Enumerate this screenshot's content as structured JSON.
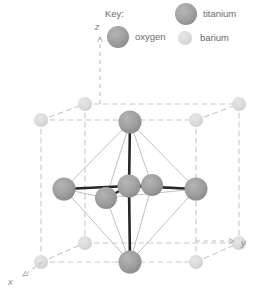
{
  "figure": {
    "kind": "crystal-structure-unit-cell"
  },
  "key": {
    "title": "Key:",
    "entries": [
      {
        "label": "titanium",
        "color": "#9e9e9e",
        "radius": 11
      },
      {
        "label": "oxygen",
        "color": "#9b9b9b",
        "radius": 11
      },
      {
        "label": "barium",
        "color": "#d9d9d9",
        "radius": 7
      }
    ]
  },
  "axes": {
    "x": {
      "label": "x"
    },
    "y": {
      "label": "y"
    },
    "z": {
      "label": "z"
    }
  },
  "colors": {
    "cell_edge": "#c9c9c9",
    "octahedron_edge": "#bfbfbf",
    "bond": "#2b2b2b",
    "background": "#ffffff",
    "text": "#6b6b6b"
  },
  "atoms": {
    "barium_corners": [
      {
        "name": "barium-corner-front-top-left",
        "x": 41,
        "y": 120
      },
      {
        "name": "barium-corner-front-top-right",
        "x": 196,
        "y": 120
      },
      {
        "name": "barium-corner-front-bottom-left",
        "x": 41,
        "y": 262
      },
      {
        "name": "barium-corner-front-bottom-right",
        "x": 196,
        "y": 262
      },
      {
        "name": "barium-corner-back-top-left",
        "x": 85,
        "y": 104
      },
      {
        "name": "barium-corner-back-top-right",
        "x": 239,
        "y": 104
      },
      {
        "name": "barium-corner-back-bottom-left",
        "x": 85,
        "y": 243
      },
      {
        "name": "barium-corner-back-bottom-right",
        "x": 239,
        "y": 243
      }
    ],
    "oxygen_faces": [
      {
        "name": "oxygen-face-top",
        "x": 130,
        "y": 122
      },
      {
        "name": "oxygen-face-bottom",
        "x": 130,
        "y": 262
      },
      {
        "name": "oxygen-face-left",
        "x": 64,
        "y": 189
      },
      {
        "name": "oxygen-face-right",
        "x": 196,
        "y": 189
      },
      {
        "name": "oxygen-face-front",
        "x": 106,
        "y": 198
      },
      {
        "name": "oxygen-face-back",
        "x": 152,
        "y": 185
      }
    ],
    "titanium_center": {
      "name": "titanium-body-centre",
      "x": 129,
      "y": 186
    }
  },
  "key_layout": {
    "title_pos": {
      "x": 105,
      "y": 14
    },
    "titanium_dot": {
      "x": 186,
      "y": 13
    },
    "titanium_text": {
      "x": 203,
      "y": 16
    },
    "oxygen_dot": {
      "x": 118,
      "y": 36
    },
    "oxygen_text": {
      "x": 135,
      "y": 39
    },
    "barium_dot": {
      "x": 185,
      "y": 37
    },
    "barium_text": {
      "x": 201,
      "y": 39
    }
  },
  "axis_layout": {
    "z": {
      "label_x": 101,
      "label_y": 28,
      "tip_x": 100,
      "tip_y": 36,
      "tail_x": 100,
      "tail_y": 104
    },
    "y": {
      "label_x": 243,
      "label_y": 245,
      "tip_x": 232,
      "tip_y": 241,
      "tail_x": 196,
      "tail_y": 241
    },
    "x": {
      "label_x": 10,
      "label_y": 281,
      "tip_x": 22,
      "tip_y": 275,
      "tail_x": 42,
      "tail_y": 262
    }
  }
}
